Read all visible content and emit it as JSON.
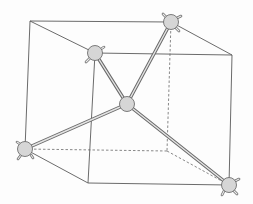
{
  "diagram": {
    "title": "",
    "colors": {
      "background": "#fdfdfd",
      "edge": "#5a5a5a",
      "atom_fill": "#d6d6d6",
      "atom_stroke": "#6e6e6e",
      "bond": "#6b6b6b"
    },
    "cube_vertices": {
      "back_top_left": [
        30,
        21
      ],
      "back_top_right": [
        171,
        22
      ],
      "front_top_left": [
        95,
        53
      ],
      "front_top_right": [
        232,
        55
      ],
      "back_bottom_left": [
        25,
        149
      ],
      "back_bottom_right": [
        167,
        151
      ],
      "front_bottom_left": [
        88,
        183
      ],
      "front_bottom_right": [
        229,
        185
      ]
    },
    "central_atom": {
      "label": "",
      "x": 127,
      "y": 104,
      "r": 7.5
    },
    "outer_atoms": [
      {
        "label": "",
        "x": 171,
        "y": 22,
        "r": 7.5,
        "corner": "back_top_right"
      },
      {
        "label": "",
        "x": 95,
        "y": 53,
        "r": 7.5,
        "corner": "front_top_left"
      },
      {
        "label": "",
        "x": 25,
        "y": 149,
        "r": 7.5,
        "corner": "back_bottom_left"
      },
      {
        "label": "",
        "x": 229,
        "y": 185,
        "r": 7.5,
        "corner": "front_bottom_right"
      }
    ],
    "bonds": [
      {
        "from": "central",
        "to": "back_top_right"
      },
      {
        "from": "central",
        "to": "front_top_left"
      },
      {
        "from": "central",
        "to": "back_bottom_left"
      },
      {
        "from": "central",
        "to": "front_bottom_right"
      }
    ],
    "hidden_edges": [
      "back_top_right-back_bottom_right",
      "back_bottom_left-back_bottom_right",
      "back_bottom_right-front_bottom_right"
    ]
  }
}
